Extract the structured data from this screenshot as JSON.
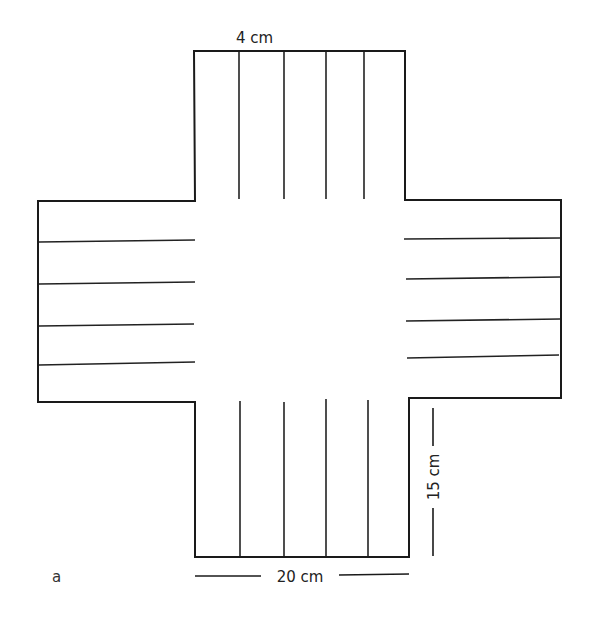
{
  "figure": {
    "panel_label": "a",
    "colors": {
      "stroke": "#1a1a1a",
      "background": "#ffffff"
    }
  },
  "dimensions": {
    "arm_spacing_label": "4 cm",
    "width_label": "20 cm",
    "arm_length_label": "15 cm"
  },
  "arms": {
    "top": {
      "line_count": 4,
      "direction": "down"
    },
    "left": {
      "line_count": 4,
      "direction": "right"
    },
    "right": {
      "line_count": 4,
      "direction": "right"
    },
    "bottom": {
      "line_count": 4,
      "direction": "down"
    }
  }
}
